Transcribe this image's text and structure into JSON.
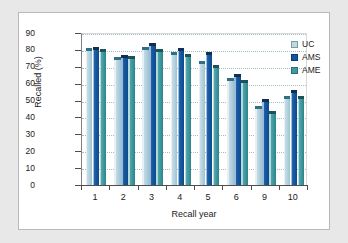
{
  "chart_data": {
    "type": "bar",
    "title": "",
    "subtitle": "",
    "xlabel": "Recall year",
    "ylabel": "Recalled (%)",
    "categories": [
      "1",
      "2",
      "3",
      "4",
      "5",
      "6",
      "9",
      "10"
    ],
    "ylim": [
      0,
      90
    ],
    "yticks": [
      0,
      10,
      20,
      30,
      40,
      50,
      60,
      70,
      80,
      90
    ],
    "grid": true,
    "legend_position": "top-right",
    "series": [
      {
        "name": "UC",
        "color": "#bcd9e3",
        "values": [
          81,
          76,
          82,
          78.5,
          73.5,
          63.5,
          46.5,
          53
        ]
      },
      {
        "name": "AMS",
        "color": "#14579e",
        "values": [
          82,
          77,
          84,
          81,
          79,
          66,
          51,
          56.5
        ]
      },
      {
        "name": "AME",
        "color": "#3f9ba0",
        "values": [
          80.5,
          76.5,
          80.5,
          77.5,
          71,
          62,
          44,
          52.5
        ]
      }
    ]
  },
  "legend": {
    "items": [
      {
        "label": "UC"
      },
      {
        "label": "AMS"
      },
      {
        "label": "AME"
      }
    ]
  },
  "colors": {
    "uc": "#bcd9e3",
    "ams": "#14579e",
    "ame": "#3f9ba0",
    "page_background": "#e8e8e8",
    "figure_background": "#ffffff",
    "axis": "#4d4d4d",
    "gridline": "#9fbfc9"
  }
}
